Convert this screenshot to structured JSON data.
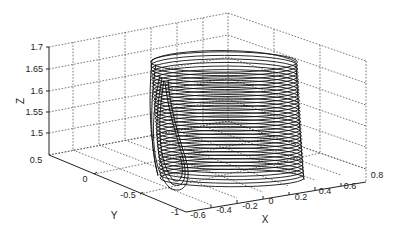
{
  "chart_data": {
    "type": "line3d",
    "title": "",
    "xlabel": "X",
    "ylabel": "Y",
    "zlabel": "Z",
    "xlim": [
      -0.6,
      0.8
    ],
    "ylim": [
      -1,
      0.5
    ],
    "zlim": [
      1.5,
      1.7
    ],
    "x_ticks": [
      "-0.6",
      "-0.4",
      "-0.2",
      "0",
      "0.2",
      "0.4",
      "0.6",
      "0.8"
    ],
    "y_ticks": [
      "-1",
      "-0.5",
      "0",
      "0.5"
    ],
    "z_ticks": [
      "1.5",
      "1.55",
      "1.6",
      "1.65",
      "1.7"
    ],
    "grid": true,
    "legend": null,
    "series": [
      {
        "name": "trajectory",
        "description": "Dense spiraling 3D trajectory forming a tilted cylindrical attractor with a loop excursion at low Y",
        "color": "#111111",
        "approx_extent": {
          "x": [
            -0.55,
            0.5
          ],
          "y": [
            -1,
            0.3
          ],
          "z": [
            1.49,
            1.67
          ]
        }
      }
    ]
  }
}
